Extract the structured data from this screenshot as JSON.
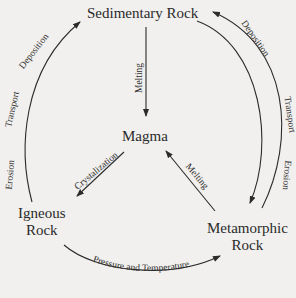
{
  "diagram": {
    "nodes": {
      "sedimentary": "Sedimentary Rock",
      "magma": "Magma",
      "igneous_line1": "Igneous",
      "igneous_line2": "Rock",
      "metamorphic_line1": "Metamorphic",
      "metamorphic_line2": "Rock"
    },
    "edges": {
      "sed_to_magma": "Melting",
      "magma_to_igneous": "Crystalization",
      "meta_to_magma": "Melting",
      "igneous_to_sed_a": "Erosion",
      "igneous_to_sed_b": "Transport",
      "igneous_to_sed_c": "Deposition",
      "igneous_to_meta": "Pressure and Temperature",
      "meta_to_sed_a": "Deposition",
      "meta_to_sed_b": "Transport",
      "meta_to_sed_c": "Erosion"
    },
    "colors": {
      "background": "#f1f0ee",
      "ink": "#2b2b2b"
    }
  }
}
